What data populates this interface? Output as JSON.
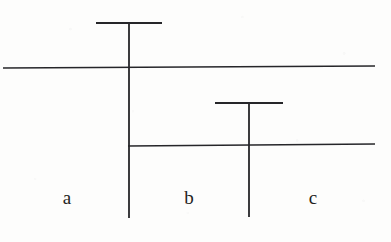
{
  "figure": {
    "kind": "line-diagram",
    "background_color": "#fdfdfc",
    "stroke_color": "#262629",
    "canvas": {
      "width": 391,
      "height": 242
    },
    "labels": [
      {
        "name": "label-a",
        "text": "a",
        "x": 67,
        "y": 204
      },
      {
        "name": "label-b",
        "text": "b",
        "x": 189,
        "y": 204
      },
      {
        "name": "label-c",
        "text": "c",
        "x": 313,
        "y": 204
      }
    ],
    "strokes": {
      "upper_horizontal": {
        "name": "upper-horizontal-line",
        "x1": 3,
        "y1": 68,
        "x2": 375,
        "y2": 66,
        "width": 1.5
      },
      "lower_horizontal": {
        "name": "lower-horizontal-line",
        "x1": 128,
        "y1": 146,
        "x2": 375,
        "y2": 144,
        "width": 1.5
      },
      "left_vertical": {
        "name": "left-vertical-line",
        "x1": 129,
        "y1": 23,
        "x2": 129,
        "y2": 218,
        "width": 1.8
      },
      "right_vertical": {
        "name": "right-vertical-line",
        "x1": 249,
        "y1": 103,
        "x2": 249,
        "y2": 217,
        "width": 1.8
      },
      "upper_tee_cap": {
        "name": "upper-tee-cap",
        "x1": 96,
        "y1": 23,
        "x2": 162,
        "y2": 23,
        "width": 2.0
      },
      "lower_tee_cap": {
        "name": "lower-tee-cap",
        "x1": 215,
        "y1": 103,
        "x2": 283,
        "y2": 103,
        "width": 2.0
      }
    }
  }
}
